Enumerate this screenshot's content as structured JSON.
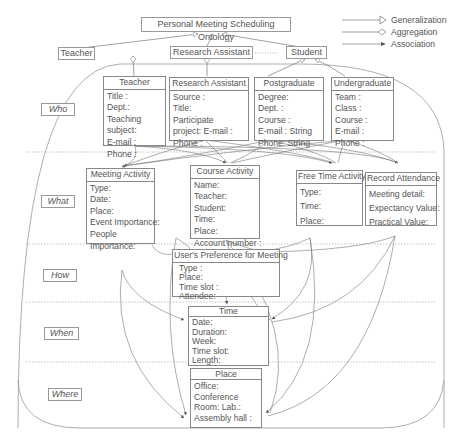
{
  "title": "Personal Meeting Scheduling Ontology",
  "legend": [
    {
      "label": "Generalization",
      "style": "hollow-triangle"
    },
    {
      "label": "Aggregation",
      "style": "hollow-diamond"
    },
    {
      "label": "Association",
      "style": "filled-arrow"
    }
  ],
  "top_level_classes": {
    "teacher": "Teacher",
    "research_assistant": "Research Assistant",
    "ellipsis": "·······",
    "student": "Student"
  },
  "layers": [
    {
      "label": "Who"
    },
    {
      "label": "What"
    },
    {
      "label": "How"
    },
    {
      "label": "When"
    },
    {
      "label": "Where"
    }
  ],
  "classes": {
    "teacher": {
      "name": "Teacher",
      "attrs": [
        "Title :",
        "Dept.:",
        "Teaching",
        "subject:",
        "E-mail :",
        "Phone :"
      ]
    },
    "research_assistant": {
      "name": "Research Assistant",
      "attrs": [
        "Source :",
        "Title:",
        "Participate",
        "project: E-mail :",
        "Phone :"
      ]
    },
    "postgraduate": {
      "name": "Postgraduate",
      "attrs": [
        "Degree:",
        "Dept. :",
        "Course :",
        "E-mail : String",
        "Phone: String"
      ]
    },
    "undergraduate": {
      "name": "Undergraduate",
      "attrs": [
        "Team :",
        "Class :",
        "Course :",
        "E-mail :",
        "Phone :"
      ]
    },
    "meeting_activity": {
      "name": "Meeting Activity",
      "attrs": [
        "Type:",
        "Date:",
        "Place:",
        "Event Importance:",
        "People",
        "Importance:"
      ]
    },
    "course_activity": {
      "name": "Course Activity",
      "attrs": [
        "Name:",
        "Teacher:",
        "Student:",
        "Time:",
        "Place:",
        "Account number :"
      ]
    },
    "free_time_activity": {
      "name": "Free Time Activity",
      "attrs": [
        "Type:",
        "Time:",
        "Place:"
      ]
    },
    "record_attendance": {
      "name": "Record Attendance",
      "attrs": [
        "Meeting detail:",
        "Expectancy Value:",
        "Practical Value:"
      ]
    },
    "users_preference": {
      "name": "User's Preference for Meeting",
      "attrs": [
        "Type :",
        "Place:",
        "Time slot :",
        "Attendee:"
      ]
    },
    "time": {
      "name": "Time",
      "attrs": [
        "Date:",
        "Duration:",
        "Week:",
        "Time slot:",
        "Length:"
      ]
    },
    "place": {
      "name": "Place",
      "attrs": [
        "Office:",
        "Conference",
        "Room: Lab.:",
        "Assembly hall :"
      ]
    }
  },
  "colors": {
    "line": "#777777",
    "text": "#555555",
    "divider": "#aaaaaa"
  }
}
